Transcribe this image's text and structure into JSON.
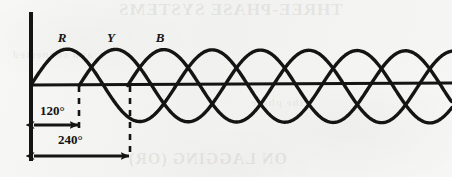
{
  "figure": {
    "background_color": "#f4f4f2",
    "ink_color": "#141414",
    "phase_labels": [
      {
        "name": "R",
        "text": "R",
        "x": 62,
        "y": 42,
        "phase_deg": 0
      },
      {
        "name": "Y",
        "text": "Y",
        "x": 111,
        "y": 42,
        "phase_deg": 120
      },
      {
        "name": "B",
        "text": "B",
        "x": 160,
        "y": 42,
        "phase_deg": 240
      }
    ],
    "angle_markers": [
      {
        "name": "first",
        "text": "120°",
        "label_x": 40,
        "label_y": 110,
        "arrow_y": 124,
        "arrow_from": 33,
        "arrow_to": 79,
        "dash_x": 79
      },
      {
        "name": "second",
        "text": "240°",
        "label_x": 58,
        "label_y": 139,
        "arrow_y": 155,
        "arrow_from": 33,
        "arrow_to": 130,
        "dash_x": 130
      }
    ],
    "axes": {
      "origin_x": 31,
      "baseline_y": 85,
      "vertical_axis_top": 12,
      "vertical_axis_bottom": 161,
      "baseline_x_end": 452
    },
    "waveform": {
      "amplitude_px": 36,
      "period_px": 145,
      "line_width_px": 3.4,
      "phase_offsets_deg": [
        0,
        120,
        240
      ],
      "x_start": 31,
      "x_end": 452
    }
  },
  "chart_data": {
    "type": "line",
    "xlabel": "Angle (degrees)",
    "ylabel": "Instantaneous value",
    "x": [
      0,
      120,
      240,
      360,
      480,
      600,
      720,
      840,
      960,
      1040
    ],
    "xlim": [
      0,
      1045
    ],
    "ylim": [
      -1,
      1
    ],
    "grid": false,
    "legend": "inline-labels-above-first-peaks",
    "series": [
      {
        "name": "R",
        "label": "R",
        "phase_deg": 0,
        "amplitude": 1,
        "equation": "v = Vm sin(θ)"
      },
      {
        "name": "Y",
        "label": "Y",
        "phase_deg": 120,
        "amplitude": 1,
        "equation": "v = Vm sin(θ − 120°)"
      },
      {
        "name": "B",
        "label": "B",
        "phase_deg": 240,
        "amplitude": 1,
        "equation": "v = Vm sin(θ − 240°)"
      }
    ],
    "annotations": [
      {
        "text": "120°",
        "from_deg": 0,
        "to_deg": 120,
        "style": "double-headed-arrow"
      },
      {
        "text": "240°",
        "from_deg": 0,
        "to_deg": 240,
        "style": "double-headed-arrow"
      }
    ]
  },
  "bleed_through": {
    "top_text": "THREE-PHASE SYSTEMS",
    "bottom_text": "ON LAGGING (OR)",
    "mid_text_a": "and connected",
    "mid_text_b": "the phase"
  }
}
